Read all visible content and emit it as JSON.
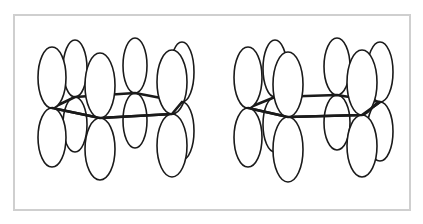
{
  "figure": {
    "frame_color": "#cfcfcf",
    "line_color": "#1a1a1a"
  },
  "molecules": [
    {
      "name": "left-benzene",
      "vertices": [
        [
          52,
          108
        ],
        [
          75,
          97
        ],
        [
          135,
          93
        ],
        [
          182,
          102
        ],
        [
          172,
          114
        ],
        [
          100,
          118
        ]
      ],
      "orbitals": [
        {
          "id": "back-left",
          "node": [
            75,
            97
          ],
          "rx": 12,
          "ry_top": 57,
          "ry_bottom": 55,
          "layer": 0
        },
        {
          "id": "back-mid",
          "node": [
            135,
            93
          ],
          "rx": 12,
          "ry_top": 55,
          "ry_bottom": 55,
          "layer": 0
        },
        {
          "id": "back-right",
          "node": [
            182,
            102
          ],
          "rx": 12,
          "ry_top": 60,
          "ry_bottom": 58,
          "layer": 0
        },
        {
          "id": "left",
          "node": [
            52,
            108
          ],
          "rx": 14,
          "ry_top": 61,
          "ry_bottom": 59,
          "layer": 1
        },
        {
          "id": "front-left",
          "node": [
            100,
            118
          ],
          "rx": 15,
          "ry_top": 65,
          "ry_bottom": 62,
          "layer": 2
        },
        {
          "id": "front-right",
          "node": [
            172,
            114
          ],
          "rx": 15,
          "ry_top": 64,
          "ry_bottom": 63,
          "layer": 2
        }
      ]
    },
    {
      "name": "right-benzene",
      "vertices": [
        [
          248,
          108
        ],
        [
          275,
          97
        ],
        [
          337,
          95
        ],
        [
          380,
          102
        ],
        [
          362,
          115
        ],
        [
          288,
          117
        ]
      ],
      "orbitals": [
        {
          "id": "back-left",
          "node": [
            275,
            97
          ],
          "rx": 12,
          "ry_top": 57,
          "ry_bottom": 55,
          "layer": 0
        },
        {
          "id": "back-mid",
          "node": [
            337,
            95
          ],
          "rx": 13,
          "ry_top": 57,
          "ry_bottom": 55,
          "layer": 0
        },
        {
          "id": "back-right",
          "node": [
            380,
            102
          ],
          "rx": 13,
          "ry_top": 60,
          "ry_bottom": 59,
          "layer": 0
        },
        {
          "id": "left",
          "node": [
            248,
            108
          ],
          "rx": 14,
          "ry_top": 61,
          "ry_bottom": 59,
          "layer": 1
        },
        {
          "id": "front-left",
          "node": [
            288,
            117
          ],
          "rx": 15,
          "ry_top": 65,
          "ry_bottom": 65,
          "layer": 2
        },
        {
          "id": "front-right",
          "node": [
            362,
            115
          ],
          "rx": 15,
          "ry_top": 65,
          "ry_bottom": 62,
          "layer": 2
        }
      ]
    }
  ]
}
